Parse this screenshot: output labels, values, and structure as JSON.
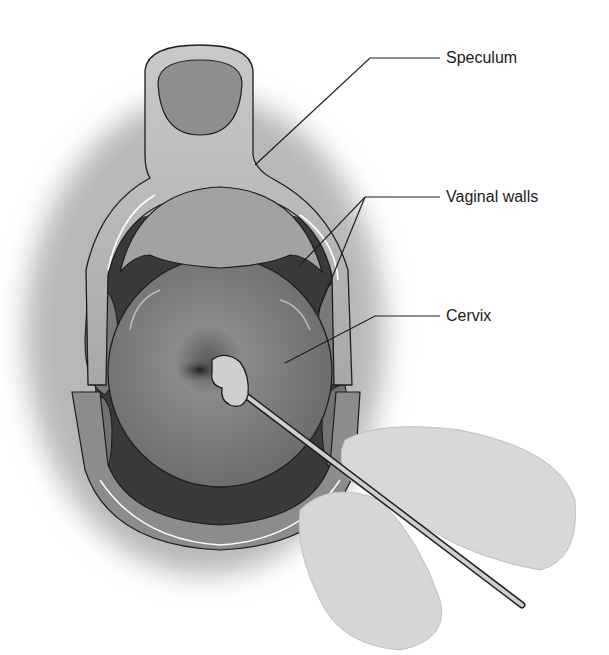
{
  "figure": {
    "labels": [
      {
        "id": "speculum",
        "text": "Speculum",
        "x": 446,
        "y": 50
      },
      {
        "id": "vaginal-walls",
        "text": "Vaginal walls",
        "x": 446,
        "y": 190
      },
      {
        "id": "cervix",
        "text": "Cervix",
        "x": 446,
        "y": 313
      }
    ]
  }
}
